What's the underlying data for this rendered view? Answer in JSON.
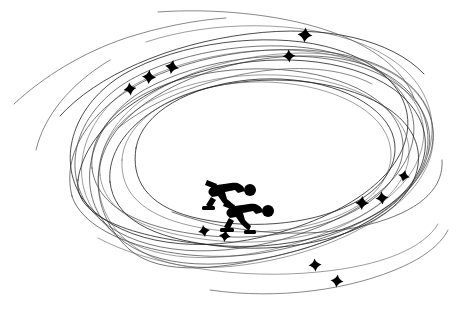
{
  "artwork": {
    "title": "Speed Skaters with Swirling Track Loops",
    "subject": "two speed skaters in crouched racing pose",
    "style": "black silhouette line art on white background",
    "width": 458,
    "height": 312,
    "background_color": "#ffffff",
    "ink_color": "#000000",
    "line_color": "#3a3a3a"
  },
  "skaters": [
    {
      "name": "rear-skater",
      "label": "Speed skater, rear",
      "pose": "crouched forward stride, arm swept back",
      "facing": "right",
      "x": 205,
      "y": 180,
      "width": 48,
      "height": 33
    },
    {
      "name": "lead-skater",
      "label": "Speed skater, lead",
      "pose": "crouched forward stride, arm swept back",
      "facing": "right",
      "x": 222,
      "y": 200,
      "width": 48,
      "height": 34
    }
  ],
  "sparkles": [
    {
      "name": "sparkle-upper-left-low",
      "x": 130,
      "y": 89,
      "size": 13,
      "rotation": -8
    },
    {
      "name": "sparkle-upper-left-mid",
      "x": 149,
      "y": 77,
      "size": 14,
      "rotation": 4
    },
    {
      "name": "sparkle-upper-left-high",
      "x": 172,
      "y": 67,
      "size": 14,
      "rotation": 10
    },
    {
      "name": "sparkle-top-right-high",
      "x": 305,
      "y": 35,
      "size": 15,
      "rotation": 6
    },
    {
      "name": "sparkle-top-right-low",
      "x": 289,
      "y": 56,
      "size": 13,
      "rotation": -4
    },
    {
      "name": "sparkle-right-far",
      "x": 404,
      "y": 176,
      "size": 12,
      "rotation": 12
    },
    {
      "name": "sparkle-right-upper",
      "x": 382,
      "y": 198,
      "size": 13,
      "rotation": -6
    },
    {
      "name": "sparkle-right-lower",
      "x": 362,
      "y": 203,
      "size": 14,
      "rotation": 3
    },
    {
      "name": "sparkle-below-skater-left",
      "x": 204,
      "y": 231,
      "size": 12,
      "rotation": -10
    },
    {
      "name": "sparkle-below-skater-right",
      "x": 225,
      "y": 236,
      "size": 12,
      "rotation": 8
    },
    {
      "name": "sparkle-bottom-mid",
      "x": 315,
      "y": 265,
      "size": 13,
      "rotation": -5
    },
    {
      "name": "sparkle-bottom-right",
      "x": 337,
      "y": 281,
      "size": 13,
      "rotation": 7
    }
  ],
  "loops": {
    "description": "overlapping hand-drawn elliptical skating-track loops",
    "count": 17,
    "paths": [
      "M 88 206 C 60 166 78 110 130 80 C 186 48 272 38 330 52 C 392 67 422 104 412 144 C 401 190 340 226 268 243 C 192 261 118 248 88 206 Z",
      "M 96 214 C 66 174 84 114 136 84 C 194 51 282 42 341 57 C 404 73 433 111 421 151 C 408 198 344 233 270 250 C 192 267 126 256 96 214 Z",
      "M 82 198 C 56 158 74 104 124 74 C 180 42 266 32 324 46 C 385 61 416 98 406 138 C 395 184 334 220 262 237 C 186 255 112 240 82 198 Z",
      "M 104 222 C 74 182 92 120 144 90 C 202 57 290 48 348 63 C 410 79 439 117 427 157 C 414 204 350 239 276 256 C 198 273 134 264 104 222 Z",
      "M 100 175 C 96 133 140 96 202 82 C 268 67 340 76 380 104 C 418 130 418 170 384 200 C 346 233 274 248 210 240 C 142 232 104 211 100 175 Z",
      "M 110 182 C 106 140 150 101 212 87 C 278 72 350 82 390 110 C 428 137 427 177 393 207 C 354 240 282 254 218 246 C 150 238 114 218 110 182 Z",
      "M 92 168 C 88 126 132 90 194 76 C 260 61 334 70 374 98 C 412 125 412 165 378 195 C 340 228 266 243 202 235 C 134 227 96 204 92 168 Z",
      "M 122 160 C 124 122 170 92 228 84 C 290 76 352 92 378 122 C 402 150 392 186 354 208 C 312 232 246 238 192 226 C 142 215 120 192 122 160 Z",
      "M 136 148 C 142 112 190 86 248 80 C 308 74 364 92 386 122 C 406 150 392 184 352 204 C 308 226 244 230 192 217 C 146 205 131 179 136 148 Z",
      "M 72 196 C 60 150 96 100 160 74 C 228 46 314 42 370 62 C 422 81 444 120 428 160 C 410 205 344 238 268 252 C 186 267 86 242 72 196 Z",
      "M 118 232 C 86 196 92 136 142 100 C 198 60 288 44 352 58 C 414 72 444 114 430 158 C 415 206 348 244 272 260 C 196 276 148 266 118 232 Z",
      "M 78 180 C 84 134 134 92 200 72 C 270 51 348 58 392 88 C 432 116 436 158 404 192 C 370 228 296 250 226 246 C 150 241 72 222 78 180 Z",
      "M 130 250 C 96 220 84 168 120 126 C 158 82 240 54 312 56 C 382 58 428 92 428 140 C 428 190 368 232 292 252 C 222 270 162 277 130 250 Z",
      "M 146 42 C 212 20 302 20 362 44 C 420 67 442 110 428 154",
      "M 60 116 C 96 76 168 44 248 34 C 326 24 392 40 424 74",
      "M 172 212 C 238 236 318 240 378 222 C 424 208 444 186 442 160",
      "M 98 238 C 150 266 240 280 318 272 C 382 266 424 248 438 224"
    ],
    "tails": [
      "M 14 104 C 44 76 84 52 126 38 C 160 27 196 20 226 18",
      "M 158 12 C 212 8 278 14 326 30 C 372 45 404 70 414 98",
      "M 118 128 C 148 104 192 84 244 74 C 296 64 342 68 372 84",
      "M 210 290 C 278 300 352 290 404 266 C 428 255 442 242 448 230",
      "M 36 150 C 44 116 70 84 110 60"
    ]
  }
}
